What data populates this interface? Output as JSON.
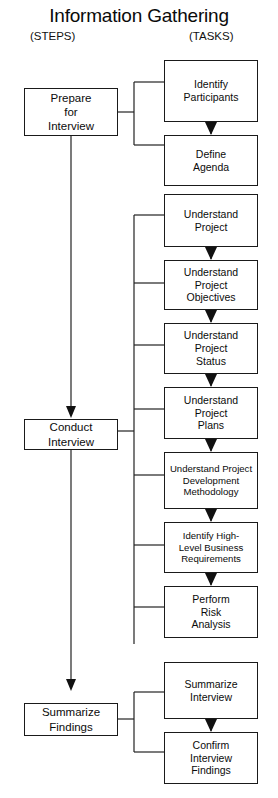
{
  "diagram": {
    "title": "Information Gathering",
    "columns": {
      "left_header": "(STEPS)",
      "right_header": "(TASKS)"
    },
    "steps": [
      {
        "id": "prepare",
        "lines": [
          "Prepare",
          "for",
          "Interview"
        ]
      },
      {
        "id": "conduct",
        "lines": [
          "Conduct",
          "Interview"
        ]
      },
      {
        "id": "summarize",
        "lines": [
          "Summarize",
          "Findings"
        ]
      }
    ],
    "tasks": [
      {
        "id": "identify-participants",
        "group": "prepare",
        "lines": [
          "Identify",
          "Participants"
        ]
      },
      {
        "id": "define-agenda",
        "group": "prepare",
        "lines": [
          "Define",
          "Agenda"
        ]
      },
      {
        "id": "understand-project",
        "group": "conduct",
        "lines": [
          "Understand",
          "Project"
        ]
      },
      {
        "id": "understand-project-objectives",
        "group": "conduct",
        "lines": [
          "Understand",
          "Project",
          "Objectives"
        ]
      },
      {
        "id": "understand-project-status",
        "group": "conduct",
        "lines": [
          "Understand",
          "Project",
          "Status"
        ]
      },
      {
        "id": "understand-project-plans",
        "group": "conduct",
        "lines": [
          "Understand",
          "Project",
          "Plans"
        ]
      },
      {
        "id": "understand-project-development-methodology",
        "group": "conduct",
        "lines": [
          "Understand Project",
          "Development",
          "Methodology"
        ]
      },
      {
        "id": "identify-high-level-business-requirements",
        "group": "conduct",
        "lines": [
          "Identify High-",
          "Level Business",
          "Requirements"
        ]
      },
      {
        "id": "perform-risk-analysis",
        "group": "conduct",
        "lines": [
          "Perform",
          "Risk",
          "Analysis"
        ]
      },
      {
        "id": "summarize-interview",
        "group": "summarize",
        "lines": [
          "Summarize",
          "Interview"
        ]
      },
      {
        "id": "confirm-interview-findings",
        "group": "summarize",
        "lines": [
          "Confirm",
          "Interview",
          "Findings"
        ]
      }
    ],
    "colors": {
      "stroke": "#222222",
      "text": "#0b0b0b",
      "background": "#ffffff"
    }
  }
}
